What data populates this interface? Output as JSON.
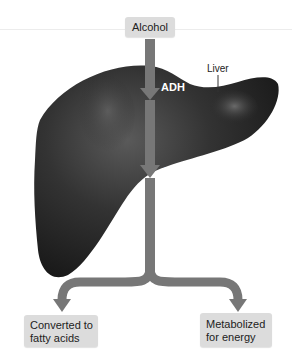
{
  "diagram": {
    "title_source": "Alcohol",
    "organ_label": "Liver",
    "enzymes": [
      "ADH",
      "ALDH"
    ],
    "outcomes": [
      {
        "line1": "Converted to",
        "line2": "fatty acids"
      },
      {
        "line1": "Metabolized",
        "line2": "for energy"
      }
    ],
    "colors": {
      "liver": "#2b2b2b",
      "arrow": "#777777",
      "box": "#dcdcdc"
    }
  }
}
